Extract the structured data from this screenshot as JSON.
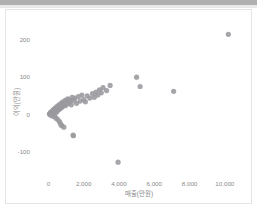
{
  "window": {
    "top_band_color": "#b0b0b0",
    "card_border_color": "#e4e4e4",
    "background": "#ffffff"
  },
  "chart_data": {
    "type": "scatter",
    "title": "",
    "xlabel": "매출(만원)",
    "ylabel": "이익(만원)",
    "xlim": [
      -700,
      11200
    ],
    "ylim": [
      -165,
      248
    ],
    "xticks": [
      0,
      2000,
      4000,
      6000,
      8000,
      10000
    ],
    "xticklabels": [
      "0",
      "2,000",
      "4,000",
      "6,000",
      "8,000",
      "10,000"
    ],
    "yticks": [
      200,
      100,
      0,
      -100
    ],
    "yticklabels": [
      "200",
      "100",
      "0",
      "-100"
    ],
    "grid": false,
    "legend": false,
    "marker_color": "#9a9a9e",
    "marker_size": 2.6,
    "series": [
      {
        "name": "매출-이익",
        "points": [
          [
            60,
            2
          ],
          [
            90,
            -1
          ],
          [
            120,
            5
          ],
          [
            150,
            0
          ],
          [
            170,
            8
          ],
          [
            200,
            3
          ],
          [
            210,
            -4
          ],
          [
            240,
            10
          ],
          [
            260,
            1
          ],
          [
            280,
            6
          ],
          [
            300,
            14
          ],
          [
            320,
            4
          ],
          [
            340,
            -6
          ],
          [
            360,
            12
          ],
          [
            380,
            2
          ],
          [
            400,
            18
          ],
          [
            420,
            9
          ],
          [
            440,
            -10
          ],
          [
            460,
            16
          ],
          [
            480,
            7
          ],
          [
            500,
            22
          ],
          [
            520,
            11
          ],
          [
            540,
            -14
          ],
          [
            560,
            20
          ],
          [
            580,
            13
          ],
          [
            600,
            26
          ],
          [
            620,
            15
          ],
          [
            640,
            -20
          ],
          [
            660,
            24
          ],
          [
            690,
            17
          ],
          [
            700,
            -26
          ],
          [
            720,
            30
          ],
          [
            740,
            19
          ],
          [
            760,
            -30
          ],
          [
            780,
            28
          ],
          [
            800,
            21
          ],
          [
            820,
            34
          ],
          [
            850,
            25
          ],
          [
            880,
            -34
          ],
          [
            900,
            32
          ],
          [
            930,
            27
          ],
          [
            960,
            38
          ],
          [
            980,
            24
          ],
          [
            1000,
            36
          ],
          [
            1050,
            29
          ],
          [
            1100,
            42
          ],
          [
            1150,
            31
          ],
          [
            1200,
            40
          ],
          [
            1250,
            35
          ],
          [
            1300,
            26
          ],
          [
            1350,
            46
          ],
          [
            1400,
            -55
          ],
          [
            1420,
            -57
          ],
          [
            1450,
            38
          ],
          [
            1500,
            44
          ],
          [
            1600,
            30
          ],
          [
            1700,
            48
          ],
          [
            1800,
            36
          ],
          [
            1900,
            52
          ],
          [
            2000,
            40
          ],
          [
            2100,
            34
          ],
          [
            2200,
            50
          ],
          [
            2350,
            44
          ],
          [
            2500,
            56
          ],
          [
            2600,
            46
          ],
          [
            2700,
            60
          ],
          [
            2800,
            52
          ],
          [
            2900,
            66
          ],
          [
            3000,
            58
          ],
          [
            3100,
            72
          ],
          [
            3300,
            64
          ],
          [
            3500,
            78
          ],
          [
            3950,
            -128
          ],
          [
            5000,
            100
          ],
          [
            5200,
            75
          ],
          [
            7100,
            62
          ],
          [
            10200,
            215
          ]
        ]
      }
    ]
  },
  "axes": {
    "x_title": "매출(만원)",
    "y_title": "이익(만원)"
  }
}
